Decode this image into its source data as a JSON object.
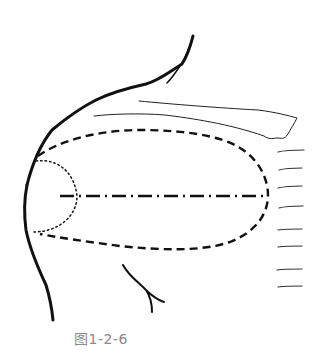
{
  "figure": {
    "caption": "图1-2-6",
    "colors": {
      "ink": "#111111",
      "caption": "#8a8a8a",
      "background": "#ffffff"
    }
  }
}
